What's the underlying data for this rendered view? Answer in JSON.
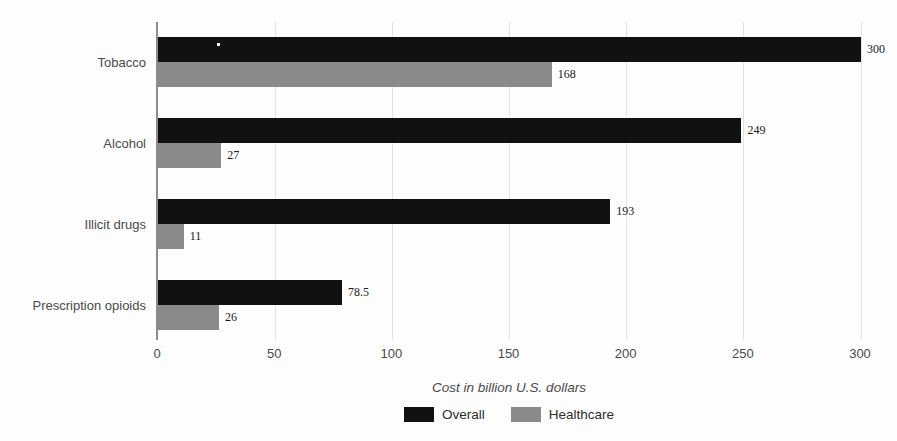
{
  "chart_data": {
    "type": "bar",
    "orientation": "horizontal",
    "categories": [
      "Tobacco",
      "Alcohol",
      "Illicit drugs",
      "Prescription opioids"
    ],
    "series": [
      {
        "name": "Overall",
        "color": "#111111",
        "values": [
          300,
          249,
          193,
          78.5
        ]
      },
      {
        "name": "Healthcare",
        "color": "#8a8a8a",
        "values": [
          168,
          27,
          11,
          26
        ]
      }
    ],
    "value_labels": {
      "Overall": [
        "300",
        "249",
        "193",
        "78.5"
      ],
      "Healthcare": [
        "168",
        "27",
        "11",
        "26"
      ]
    },
    "xlabel": "Cost in billion U.S. dollars",
    "x_ticks": [
      0,
      50,
      100,
      150,
      200,
      250,
      300
    ],
    "xlim": [
      0,
      300
    ],
    "grid": "vertical-light",
    "legend_position": "bottom",
    "legend_entries": [
      "Overall",
      "Healthcare"
    ]
  },
  "colors": {
    "overall_bar": "#111111",
    "healthcare_bar": "#8a8a8a",
    "gridline": "#e2e2e2",
    "axis_line": "#8c8c8c",
    "label_text": "#4a4a4a",
    "value_text": "#1c1c1c",
    "background": "#fdfdfd"
  }
}
